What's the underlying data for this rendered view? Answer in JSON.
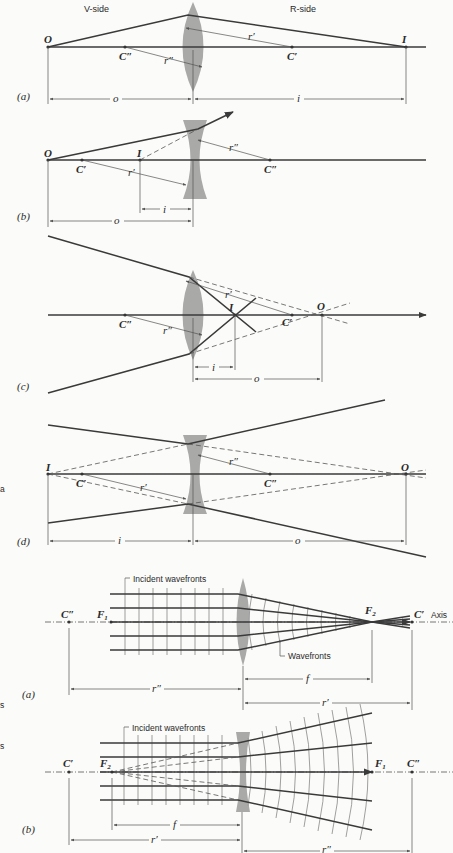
{
  "figure_1": {
    "side_labels": {
      "left": "V-side",
      "right": "R-side"
    },
    "panels": [
      {
        "id": "a",
        "label": "(a)",
        "lens_type": "converging",
        "points": {
          "object": "O",
          "image": "I",
          "center_left": "C″",
          "center_right": "C′"
        },
        "radii": {
          "r1": "r′",
          "r2": "r″"
        },
        "distances": {
          "object_distance": "o",
          "image_distance": "i"
        }
      },
      {
        "id": "b",
        "label": "(b)",
        "lens_type": "diverging",
        "points": {
          "object": "O",
          "image": "I",
          "center_left": "C′",
          "center_right": "C″"
        },
        "radii": {
          "r1": "r′",
          "r2": "r″"
        },
        "distances": {
          "object_distance": "o",
          "image_distance": "i"
        }
      },
      {
        "id": "c",
        "label": "(c)",
        "lens_type": "converging",
        "points": {
          "object": "O",
          "image": "I",
          "center_left": "C″",
          "center_right": "C′"
        },
        "radii": {
          "r1": "r′",
          "r2": "r″"
        },
        "distances": {
          "object_distance": "o",
          "image_distance": "i"
        }
      },
      {
        "id": "d",
        "label": "(d)",
        "lens_type": "diverging",
        "points": {
          "object": "O",
          "image": "I",
          "center_left": "C′",
          "center_right": "C″"
        },
        "radii": {
          "r1": "r′",
          "r2": "r″"
        },
        "distances": {
          "object_distance": "o",
          "image_distance": "i"
        }
      }
    ]
  },
  "figure_2": {
    "panels": [
      {
        "id": "a",
        "label": "(a)",
        "lens_type": "converging",
        "annotations": {
          "incident": "Incident wavefronts",
          "refracted": "Wavefronts",
          "axis": "Axis"
        },
        "points": {
          "center_left": "C″",
          "focus_left": "F",
          "focus_left_sub": "1",
          "focus_right": "F",
          "focus_right_sub": "2",
          "center_right": "C′"
        },
        "distances": {
          "focal": "f",
          "r_left": "r″",
          "r_right": "r′"
        }
      },
      {
        "id": "b",
        "label": "(b)",
        "lens_type": "diverging",
        "annotations": {
          "incident": "Incident wavefronts"
        },
        "points": {
          "center_left": "C′",
          "focus_left": "F",
          "focus_left_sub": "2",
          "focus_right": "F",
          "focus_right_sub": "1",
          "center_right": "C″"
        },
        "distances": {
          "focal": "f",
          "r_left": "r′",
          "r_right": "r″"
        }
      }
    ]
  },
  "margin_fragments": [
    "a",
    "s",
    "s"
  ]
}
